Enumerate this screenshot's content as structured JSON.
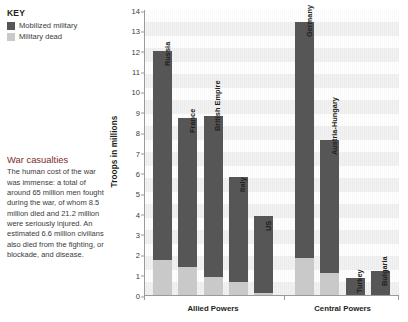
{
  "legend": {
    "title": "KEY",
    "items": [
      {
        "label": "Mobilized military",
        "color": "#565656",
        "icon": "legend-swatch-square"
      },
      {
        "label": "Military dead",
        "color": "#c9c9c9",
        "icon": "legend-swatch-square"
      }
    ]
  },
  "caption": {
    "heading": "War casualties",
    "heading_color": "#7b2b2b",
    "body": "The human cost of the war was immense: a total of around 65 million men fought during the war, of whom 8.5 million died and 21.2 million were seriously injured. An estimated 6.6 million civilians also died from the fighting, or blockade, and disease."
  },
  "chart_data": {
    "type": "bar",
    "subtype": "stacked-vertical",
    "title": "",
    "xlabel": "",
    "ylabel": "Troops in millions",
    "ylim": [
      0,
      14
    ],
    "yticks": [
      0,
      1,
      2,
      3,
      4,
      5,
      6,
      7,
      8,
      9,
      10,
      11,
      12,
      13,
      14
    ],
    "ytick_labels": [
      "0",
      "1",
      "2",
      "3",
      "4",
      "5",
      "6",
      "7",
      "8",
      "9",
      "10",
      "11",
      "12",
      "13",
      "14"
    ],
    "grid": "horizontal-bands",
    "legend_position": "top-left-outside",
    "categories": [
      "Russia",
      "France",
      "British Empire",
      "Italy",
      "US",
      "Germany",
      "Austria-Hungary",
      "Turkey",
      "Bulgaria"
    ],
    "series": [
      {
        "name": "Mobilized military",
        "color": "#565656",
        "values": [
          12.0,
          8.7,
          8.8,
          5.8,
          3.9,
          13.4,
          7.6,
          0.85,
          1.2
        ]
      },
      {
        "name": "Military dead",
        "color": "#c9c9c9",
        "values": [
          1.7,
          1.4,
          0.9,
          0.65,
          0.12,
          1.8,
          1.1,
          0.0,
          0.0
        ]
      }
    ],
    "groups": [
      {
        "label": "Allied Powers",
        "categories": [
          "Russia",
          "France",
          "British Empire",
          "Italy",
          "US"
        ]
      },
      {
        "label": "Central Powers",
        "categories": [
          "Germany",
          "Austria-Hungary",
          "Turkey",
          "Bulgaria"
        ]
      }
    ]
  }
}
